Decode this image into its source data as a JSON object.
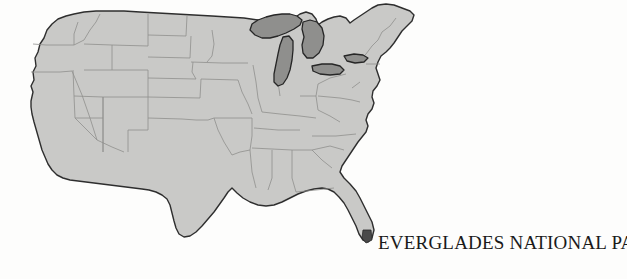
{
  "figure": {
    "caption": "EVERGLADES NATIONAL PARK",
    "background_color": "#fdfdfc",
    "kind": "map"
  },
  "map": {
    "title": "EVERGLADES NATIONAL PARK",
    "region": "Contiguous United States",
    "projection_look": "conic",
    "colors": {
      "land_fill": "#c9c9c7",
      "land_outline": "#2e2e2e",
      "state_border": "#8a8a88",
      "water_fill": "#8f8f8d",
      "water_outline": "#262626",
      "marker_fill": "#4a4a4a",
      "background": "#fdfdfc",
      "caption_text": "#1a1a1a"
    },
    "water_bodies": [
      {
        "name": "Lake Superior"
      },
      {
        "name": "Lake Michigan"
      },
      {
        "name": "Lake Huron"
      },
      {
        "name": "Lake Erie"
      },
      {
        "name": "Lake Ontario"
      }
    ],
    "markers": [
      {
        "name": "Everglades National Park",
        "state": "Florida",
        "position": "southern tip of Florida peninsula"
      }
    ],
    "state_divisions_visible": true,
    "labels_visible": false
  }
}
